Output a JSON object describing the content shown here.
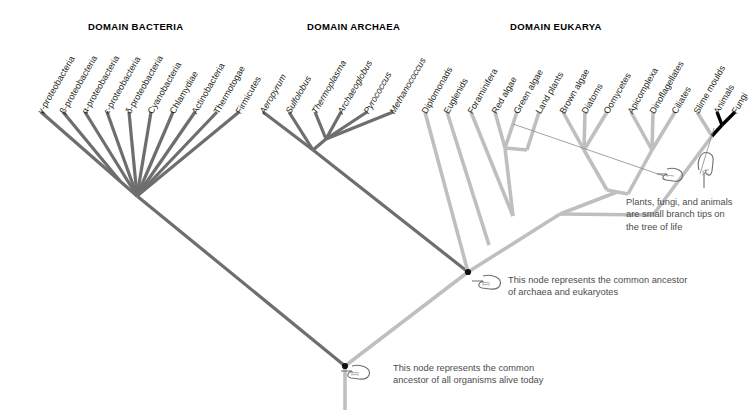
{
  "figure": {
    "type": "phylogenetic-tree"
  },
  "domains": [
    {
      "id": "bacteria",
      "header": "DOMAIN BACTERIA",
      "color": "#6e6e6e"
    },
    {
      "id": "archaea",
      "header": "DOMAIN ARCHAEA",
      "color": "#6e6e6e"
    },
    {
      "id": "eukarya",
      "header": "DOMAIN EUKARYA",
      "color": "#bfbfbf"
    }
  ],
  "tips": {
    "bacteria": [
      {
        "label": "γ-proteobacteria",
        "italic": false,
        "x": 40,
        "y": 112
      },
      {
        "label": "β-proteobacteria",
        "italic": false,
        "x": 62,
        "y": 112
      },
      {
        "label": "α-proteobacteria",
        "italic": false,
        "x": 84,
        "y": 112
      },
      {
        "label": "ε-proteobacteria",
        "italic": false,
        "x": 106,
        "y": 112
      },
      {
        "label": "δ-proteobacteria",
        "italic": false,
        "x": 128,
        "y": 112
      },
      {
        "label": "Cyanobacteria",
        "italic": false,
        "x": 150,
        "y": 112
      },
      {
        "label": "Chlamydiae",
        "italic": false,
        "x": 172,
        "y": 112
      },
      {
        "label": "Actinobacteria",
        "italic": false,
        "x": 194,
        "y": 112
      },
      {
        "label": "Thermotogae",
        "italic": false,
        "x": 216,
        "y": 112
      },
      {
        "label": "Firmicutes",
        "italic": false,
        "x": 238,
        "y": 112
      }
    ],
    "archaea": [
      {
        "label": "Aeropyrum",
        "italic": true,
        "x": 262,
        "y": 112
      },
      {
        "label": "Sulfolobus",
        "italic": true,
        "x": 288,
        "y": 112
      },
      {
        "label": "Thermoplasma",
        "italic": true,
        "x": 314,
        "y": 112
      },
      {
        "label": "Archaeoglobus",
        "italic": true,
        "x": 340,
        "y": 112
      },
      {
        "label": "Pyrococcus",
        "italic": true,
        "x": 366,
        "y": 112
      },
      {
        "label": "Methanococcus",
        "italic": true,
        "x": 392,
        "y": 112
      }
    ],
    "eukarya": [
      {
        "label": "Diplomonads",
        "italic": false,
        "x": 424,
        "y": 112
      },
      {
        "label": "Euglenids",
        "italic": false,
        "x": 446,
        "y": 112
      },
      {
        "label": "Foraminifera",
        "italic": false,
        "x": 470,
        "y": 112
      },
      {
        "label": "Red algae",
        "italic": false,
        "x": 494,
        "y": 112
      },
      {
        "label": "Green algae",
        "italic": false,
        "x": 516,
        "y": 112
      },
      {
        "label": "Land plants",
        "italic": false,
        "x": 538,
        "y": 112
      },
      {
        "label": "Brown algae",
        "italic": false,
        "x": 562,
        "y": 112
      },
      {
        "label": "Diatoms",
        "italic": false,
        "x": 584,
        "y": 112
      },
      {
        "label": "Oomycetes",
        "italic": false,
        "x": 606,
        "y": 112
      },
      {
        "label": "Apicomplexa",
        "italic": false,
        "x": 630,
        "y": 112
      },
      {
        "label": "Dinoflagellates",
        "italic": false,
        "x": 652,
        "y": 112
      },
      {
        "label": "Ciliates",
        "italic": false,
        "x": 674,
        "y": 112
      },
      {
        "label": "Slime moulds",
        "italic": false,
        "x": 696,
        "y": 112
      },
      {
        "label": "Animals",
        "italic": false,
        "x": 716,
        "y": 112
      },
      {
        "label": "Fungi",
        "italic": false,
        "x": 734,
        "y": 112
      }
    ]
  },
  "annotations": [
    {
      "id": "root-node",
      "text": "This node represents the common ancestor of all organisms alive today",
      "points_to": "root-node-dot"
    },
    {
      "id": "archaea-eukarya-node",
      "text": "This node represents the common ancestor of archaea and eukaryotes",
      "points_to": "archaea-eukarya-node-dot"
    },
    {
      "id": "branch-tips",
      "text": "Plants, fungi, and animals are small branch tips on the tree of life",
      "points_to": "animals-fungi-clade"
    }
  ],
  "nodes": {
    "root": {
      "x": 345,
      "y": 366
    },
    "archaea_eukarya": {
      "x": 468,
      "y": 272
    },
    "bacteria_crown": {
      "x": 137,
      "y": 196
    },
    "archaea_crown": {
      "x": 313,
      "y": 150
    }
  },
  "colors": {
    "bacteria_branch": "#6e6e6e",
    "archaea_branch": "#6e6e6e",
    "eukarya_branch": "#bfbfbf",
    "highlight_branch": "#000000",
    "node_dot": "#111111",
    "annotation_text": "#4d4d4d",
    "header_text": "#000000",
    "background": "#ffffff"
  }
}
